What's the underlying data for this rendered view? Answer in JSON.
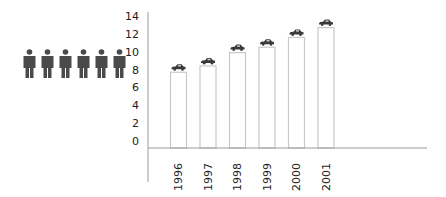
{
  "chart_data": {
    "type": "bar",
    "title": "",
    "xlabel": "",
    "ylabel": "",
    "categories": [
      "1996",
      "1997",
      "1998",
      "1999",
      "2000",
      "2001"
    ],
    "values": [
      7.7,
      8.4,
      9.9,
      10.5,
      11.6,
      12.7
    ],
    "ylim": [
      0,
      14
    ],
    "yticks": [
      0,
      2,
      4,
      6,
      8,
      10,
      12,
      14
    ],
    "ytick_labels": [
      "0",
      "2",
      "4",
      "6",
      "8",
      "10",
      "12",
      "14"
    ],
    "grid": false,
    "legend": null,
    "bar_style": {
      "fill": "#ffffff",
      "stroke": "#c8c8c8"
    },
    "bar_marker_icon": "car-icon",
    "annotations": [
      {
        "type": "icon-group",
        "icon": "person-icon",
        "count": 6,
        "position": "left of y-axis"
      }
    ],
    "colors": {
      "axis": "#9a9a9a",
      "bar_outline": "#c8c8c8",
      "person": "#4a4a4a",
      "car": "#3a3a3a",
      "text": "#222222"
    }
  }
}
